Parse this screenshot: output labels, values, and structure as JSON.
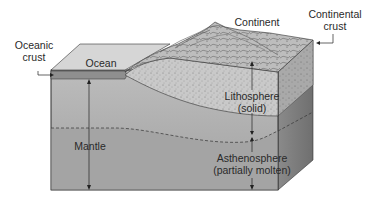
{
  "figure": {
    "type": "block-diagram"
  },
  "labels": {
    "oceanic_crust_line1": "Oceanic",
    "oceanic_crust_line2": "crust",
    "ocean": "Ocean",
    "continent": "Continent",
    "continental_crust_line1": "Continental",
    "continental_crust_line2": "crust",
    "lithosphere_line1": "Lithosphere",
    "lithosphere_line2": "(solid)",
    "mantle": "Mantle",
    "asthenosphere_line1": "Asthenosphere",
    "asthenosphere_line2": "(partially molten)"
  },
  "colors": {
    "top_ocean": "#d6d6d6",
    "oceanic_crust": "#8f8f8f",
    "lithosphere_front": "#b9b9b9",
    "asthenosphere_front": "#a6a6a6",
    "side_upper": "#8c8c8c",
    "side_lower": "#7a7a7a",
    "continent": "#c8c8c8",
    "line": "#222222"
  }
}
